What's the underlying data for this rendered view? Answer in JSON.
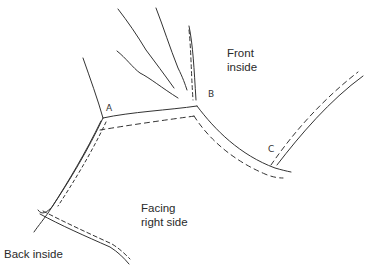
{
  "diagram": {
    "type": "hand-drawn sewing/pattern sketch",
    "labels": {
      "front_inside": "Front\ninside",
      "facing_right_side": "Facing\nright side",
      "back_inside": "Back inside"
    },
    "points": {
      "a": "A",
      "b": "B",
      "c": "C"
    },
    "line_color": "#333333"
  }
}
